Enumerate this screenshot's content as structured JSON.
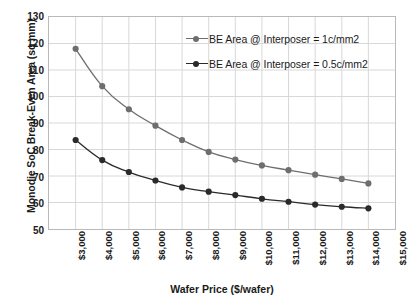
{
  "chart_data": {
    "type": "line",
    "title": "",
    "xlabel": "Wafer Price ($/wafer)",
    "ylabel": "Monodie SoC Break-Even Area (sq mm)",
    "xlim": [
      3000,
      16000
    ],
    "ylim": [
      50,
      130
    ],
    "grid": true,
    "legend_position": "top-right",
    "x_tick_labels": [
      "$3,000",
      "$4,000",
      "$5,000",
      "$6,000",
      "$7,000",
      "$8,000",
      "$9,000",
      "$10,000",
      "$11,000",
      "$12,000",
      "$13,000",
      "$14,000",
      "$15,000",
      "$16,000"
    ],
    "x_tick_values": [
      3000,
      4000,
      5000,
      6000,
      7000,
      8000,
      9000,
      10000,
      11000,
      12000,
      13000,
      14000,
      15000,
      16000
    ],
    "y_tick_labels": [
      "50",
      "60",
      "70",
      "80",
      "90",
      "100",
      "110",
      "120",
      "130"
    ],
    "y_tick_values": [
      50,
      60,
      70,
      80,
      90,
      100,
      110,
      120,
      130
    ],
    "x": [
      4000,
      5000,
      6000,
      7000,
      8000,
      9000,
      10000,
      11000,
      12000,
      13000,
      14000,
      15000
    ],
    "series": [
      {
        "name": "BE Area @ Interposer = 1c/mm2",
        "color": "#6e6e6e",
        "marker": "circle",
        "values": [
          118.0,
          103.9,
          95.2,
          89.0,
          83.6,
          79.1,
          76.2,
          74.0,
          72.2,
          70.5,
          68.9,
          67.2
        ]
      },
      {
        "name": "BE Area @ Interposer = 0.5c/mm2",
        "color": "#2a2a2a",
        "marker": "circle",
        "values": [
          83.6,
          76.0,
          71.5,
          68.3,
          65.7,
          64.1,
          62.8,
          61.4,
          60.3,
          59.2,
          58.4,
          57.8
        ]
      }
    ]
  },
  "legend": {
    "entries": [
      {
        "label": "BE Area @ Interposer = 1c/mm2"
      },
      {
        "label": "BE Area @ Interposer = 0.5c/mm2"
      }
    ]
  },
  "axes": {
    "x_title": "Wafer Price ($/wafer)",
    "y_title": "Monodie SoC Break-Even Area (sq mm)"
  },
  "colors": {
    "series_light": "#6e6e6e",
    "series_dark": "#2a2a2a",
    "grid": "#d8d8d8",
    "frame": "#b9b9b9",
    "text": "#1a1a1a",
    "background": "#ffffff"
  }
}
